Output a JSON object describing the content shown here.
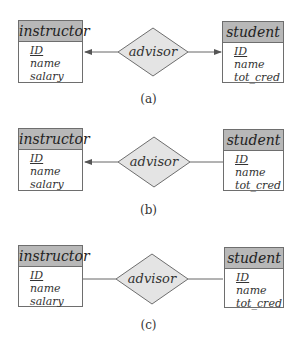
{
  "figures": [
    {
      "caption": "(a)",
      "left_entity": {
        "name": "instructor",
        "attributes": [
          {
            "name": "ID",
            "primary_key": true
          },
          {
            "name": "name"
          },
          {
            "name": "salary"
          }
        ]
      },
      "relationship": {
        "name": "advisor"
      },
      "right_entity": {
        "name": "student",
        "attributes": [
          {
            "name": "ID",
            "primary_key": true
          },
          {
            "name": "name"
          },
          {
            "name": "tot_cred"
          }
        ]
      },
      "left_arrow": true,
      "right_arrow": true
    },
    {
      "caption": "(b)",
      "left_entity": {
        "name": "instructor",
        "attributes": [
          {
            "name": "ID",
            "primary_key": true
          },
          {
            "name": "name"
          },
          {
            "name": "salary"
          }
        ]
      },
      "relationship": {
        "name": "advisor"
      },
      "right_entity": {
        "name": "student",
        "attributes": [
          {
            "name": "ID",
            "primary_key": true
          },
          {
            "name": "name"
          },
          {
            "name": "tot_cred"
          }
        ]
      },
      "left_arrow": true,
      "right_arrow": false
    },
    {
      "caption": "(c)",
      "left_entity": {
        "name": "instructor",
        "attributes": [
          {
            "name": "ID",
            "primary_key": true
          },
          {
            "name": "name"
          },
          {
            "name": "salary"
          }
        ]
      },
      "relationship": {
        "name": "advisor"
      },
      "right_entity": {
        "name": "student",
        "attributes": [
          {
            "name": "ID",
            "primary_key": true
          },
          {
            "name": "name"
          },
          {
            "name": "tot_cred"
          }
        ]
      },
      "left_arrow": false,
      "right_arrow": false
    }
  ],
  "colors": {
    "entity_header": "#b8b8b8",
    "diamond_fill": "#e4e4e4",
    "stroke": "#6e6e6e"
  }
}
